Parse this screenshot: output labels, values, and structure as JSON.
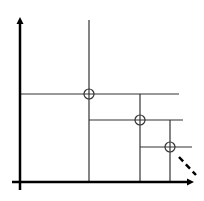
{
  "diagram": {
    "type": "staircase-frontier",
    "colors": {
      "background": "#ffffff",
      "axis": "#000000",
      "line": "#333333",
      "dashed": "#000000"
    },
    "axes": {
      "origin": [
        20,
        182
      ],
      "y_axis_top": 17,
      "x_axis_right": 194
    },
    "points": [
      {
        "id": "p1",
        "cx": 89,
        "cy": 94,
        "r": 5,
        "vline_top": 20,
        "hline_left": 20,
        "hline_right": 179
      },
      {
        "id": "p2",
        "cx": 140,
        "cy": 120,
        "r": 5,
        "vline_top": 94,
        "hline_left": 89,
        "hline_right": 183
      },
      {
        "id": "p3",
        "cx": 170,
        "cy": 147,
        "r": 5,
        "vline_top": 120,
        "hline_left": 140,
        "hline_right": 192
      }
    ],
    "continuation": {
      "x1": 179,
      "y1": 157,
      "x2": 196,
      "y2": 175,
      "style": "dashed"
    }
  }
}
